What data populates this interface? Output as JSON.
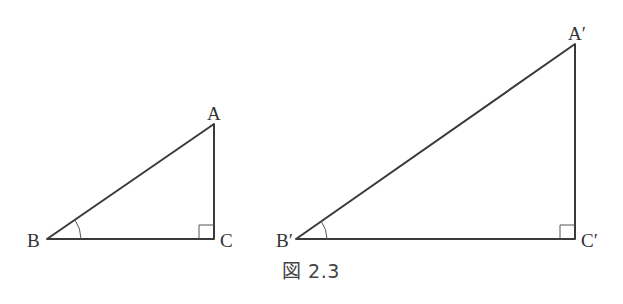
{
  "caption": "図 2.3",
  "triangles": [
    {
      "name": "ABC",
      "labels": {
        "A": "A",
        "B": "B",
        "C": "C"
      },
      "vertices": {
        "A": [
          214,
          124
        ],
        "B": [
          47,
          239
        ],
        "C": [
          214,
          239
        ]
      },
      "right_angle_at": "C",
      "marked_angle_at": "B"
    },
    {
      "name": "A′B′C′",
      "labels": {
        "A": "A′",
        "B": "B′",
        "C": "C′"
      },
      "vertices": {
        "A": [
          575,
          44
        ],
        "B": [
          296,
          239
        ],
        "C": [
          575,
          239
        ]
      },
      "right_angle_at": "C′",
      "marked_angle_at": "B′"
    }
  ],
  "colors": {
    "line": "#3a3a3a",
    "text": "#333333",
    "background": "#ffffff"
  }
}
